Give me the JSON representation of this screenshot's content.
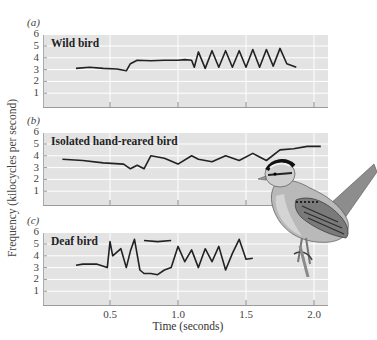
{
  "figure": {
    "ylabel": "Frequency (kilocycles per second)",
    "xlabel": "Time (seconds)",
    "xticks": [
      "0.5",
      "1.0",
      "1.5",
      "2.0"
    ],
    "yticks": [
      "6",
      "5",
      "4",
      "3",
      "2",
      "1"
    ],
    "panels": [
      {
        "letter": "(a)",
        "title": "Wild bird"
      },
      {
        "letter": "(b)",
        "title": "Isolated hand-reared bird"
      },
      {
        "letter": "(c)",
        "title": "Deaf bird"
      }
    ],
    "illustration": "white-crowned-sparrow",
    "colors": {
      "panel_bg": "#e3e3e3",
      "grid": "#ffffff",
      "trace": "#222222"
    }
  },
  "chart_data": [
    {
      "type": "line",
      "title": "(a) Wild bird",
      "xlabel": "Time (seconds)",
      "ylabel": "Frequency (kilocycles per second)",
      "xlim": [
        0,
        2.1
      ],
      "ylim": [
        0,
        6
      ],
      "xticks": [
        0.5,
        1.0,
        1.5,
        2.0
      ],
      "yticks": [
        1,
        2,
        3,
        4,
        5,
        6
      ],
      "grid": true,
      "series": [
        {
          "name": "Wild bird",
          "x": [
            0.25,
            0.35,
            0.45,
            0.55,
            0.62,
            0.65,
            0.7,
            0.8,
            0.9,
            1.0,
            1.05,
            1.1,
            1.12,
            1.15,
            1.2,
            1.25,
            1.3,
            1.35,
            1.4,
            1.45,
            1.5,
            1.55,
            1.6,
            1.65,
            1.7,
            1.75,
            1.8,
            1.87
          ],
          "y": [
            3.1,
            3.2,
            3.1,
            3.05,
            2.9,
            3.5,
            3.8,
            3.75,
            3.8,
            3.8,
            3.85,
            3.8,
            3.2,
            4.5,
            3.1,
            4.6,
            3.2,
            4.6,
            3.2,
            4.6,
            3.2,
            4.7,
            3.2,
            4.7,
            3.3,
            4.8,
            3.5,
            3.2
          ]
        }
      ]
    },
    {
      "type": "line",
      "title": "(b) Isolated hand-reared bird",
      "xlabel": "Time (seconds)",
      "ylabel": "Frequency (kilocycles per second)",
      "xlim": [
        0,
        2.1
      ],
      "ylim": [
        0,
        6
      ],
      "xticks": [
        0.5,
        1.0,
        1.5,
        2.0
      ],
      "yticks": [
        1,
        2,
        3,
        4,
        5,
        6
      ],
      "grid": true,
      "series": [
        {
          "name": "Isolated hand-reared bird",
          "x": [
            0.15,
            0.3,
            0.45,
            0.6,
            0.65,
            0.7,
            0.75,
            0.8,
            0.85,
            0.9,
            1.0,
            1.1,
            1.15,
            1.25,
            1.35,
            1.45,
            1.55,
            1.6,
            1.65,
            1.75,
            1.85,
            1.95,
            2.05
          ],
          "y": [
            3.7,
            3.6,
            3.4,
            3.3,
            2.9,
            3.2,
            2.9,
            4.0,
            3.9,
            3.8,
            3.3,
            4.0,
            3.7,
            3.5,
            4.0,
            3.6,
            4.2,
            3.9,
            3.6,
            4.5,
            4.6,
            4.8,
            4.8
          ]
        }
      ]
    },
    {
      "type": "line",
      "title": "(c) Deaf bird",
      "xlabel": "Time (seconds)",
      "ylabel": "Frequency (kilocycles per second)",
      "xlim": [
        0,
        2.1
      ],
      "ylim": [
        0,
        6
      ],
      "xticks": [
        0.5,
        1.0,
        1.5,
        2.0
      ],
      "yticks": [
        1,
        2,
        3,
        4,
        5,
        6
      ],
      "grid": true,
      "series": [
        {
          "name": "Deaf bird (lower trace)",
          "x": [
            0.25,
            0.3,
            0.4,
            0.48,
            0.5,
            0.52,
            0.58,
            0.62,
            0.65,
            0.68,
            0.72,
            0.75,
            0.8,
            0.85,
            0.9,
            0.95,
            1.0,
            1.05,
            1.1,
            1.15,
            1.2,
            1.25,
            1.3,
            1.35,
            1.4,
            1.45,
            1.5,
            1.55
          ],
          "y": [
            3.2,
            3.3,
            3.3,
            3.0,
            5.2,
            4.0,
            4.6,
            3.0,
            4.4,
            5.4,
            2.8,
            2.5,
            2.5,
            2.4,
            2.8,
            3.0,
            4.8,
            3.5,
            4.5,
            3.0,
            4.6,
            3.5,
            4.8,
            2.8,
            4.2,
            5.4,
            3.7,
            3.8
          ]
        },
        {
          "name": "Deaf bird (upper trace)",
          "x": [
            0.75,
            0.85,
            0.95
          ],
          "y": [
            5.3,
            5.2,
            5.3
          ]
        }
      ]
    }
  ]
}
